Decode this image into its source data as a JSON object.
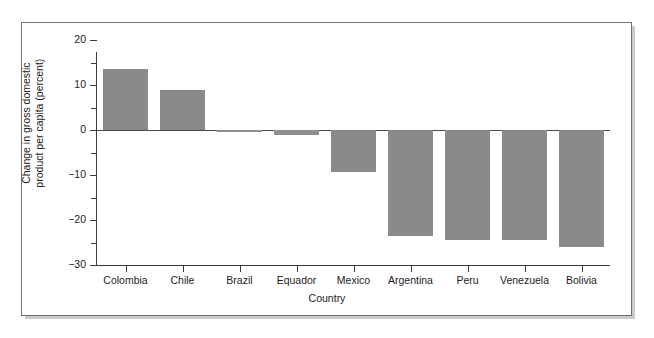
{
  "chart_data": {
    "type": "bar",
    "title": "",
    "xlabel": "Country",
    "ylabel": "Change in gross domestic product per capita (percent)",
    "ylabel_line1": "Change in gross domestic",
    "ylabel_line2": "product per capita (percent)",
    "categories": [
      "Colombia",
      "Chile",
      "Brazil",
      "Equador",
      "Mexico",
      "Argentina",
      "Peru",
      "Venezuela",
      "Bolivia"
    ],
    "values": [
      13.5,
      9,
      -0.5,
      -1,
      -9.3,
      -23.5,
      -24.5,
      -24.5,
      -26
    ],
    "ylim": [
      -30,
      20
    ],
    "ytick_labels": [
      "20",
      "10",
      "0",
      "−10",
      "−20",
      "−30"
    ],
    "ytick_values": [
      20,
      10,
      0,
      -10,
      -20,
      -30
    ],
    "yminor_values": [
      15,
      5,
      -5,
      -15,
      -25
    ],
    "grid": false,
    "legend": null,
    "bar_color": "#8a8a8a",
    "axis_color": "#3a3a3a",
    "background_color": "#ffffff",
    "frame_border_color": "#6f6f6f"
  }
}
